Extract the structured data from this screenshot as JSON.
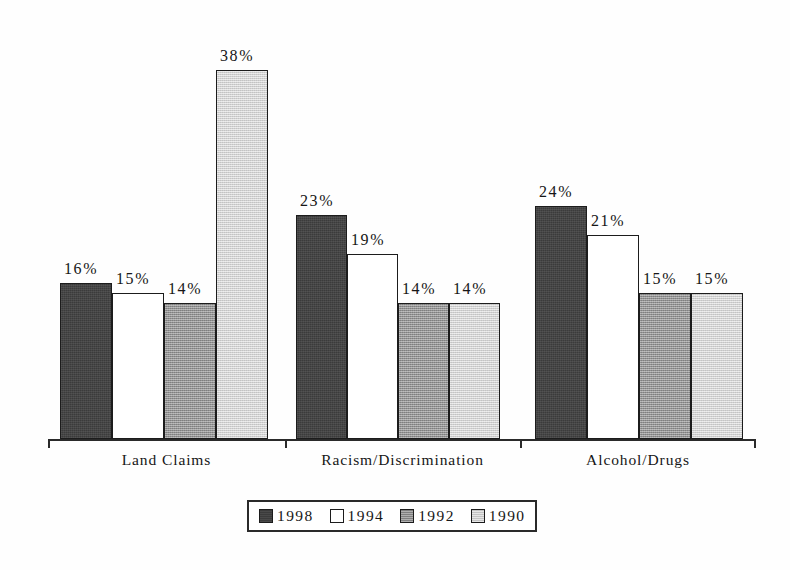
{
  "chart_data": {
    "type": "bar",
    "title": "",
    "subtitle": "",
    "xlabel": "",
    "ylabel": "",
    "ylim": [
      0,
      40
    ],
    "grid": false,
    "legend_position": "bottom",
    "value_suffix": "%",
    "categories": [
      "Land Claims",
      "Racism/Discrimination",
      "Alcohol/Drugs"
    ],
    "series": [
      {
        "name": "1998",
        "color": "#3b3b3b",
        "values": [
          16,
          23,
          24
        ]
      },
      {
        "name": "1994",
        "color": "#ffffff",
        "values": [
          15,
          19,
          21
        ]
      },
      {
        "name": "1992",
        "color": "#8d8d8d",
        "values": [
          14,
          14,
          15
        ]
      },
      {
        "name": "1990",
        "color": "#d2d2d2",
        "values": [
          38,
          14,
          15
        ]
      }
    ],
    "data_labels": [
      [
        "16%",
        "15%",
        "14%",
        "38%"
      ],
      [
        "23%",
        "19%",
        "14%",
        "14%"
      ],
      [
        "24%",
        "21%",
        "15%",
        "15%"
      ]
    ]
  },
  "legend": {
    "items": [
      {
        "label": "1998",
        "swatch": "#3b3b3b"
      },
      {
        "label": "1994",
        "swatch": "#ffffff"
      },
      {
        "label": "1992",
        "swatch": "#8d8d8d"
      },
      {
        "label": "1990",
        "swatch": "#d2d2d2"
      }
    ]
  },
  "axis": {
    "categories": [
      "Land Claims",
      "Racism/Discrimination",
      "Alcohol/Drugs"
    ]
  }
}
